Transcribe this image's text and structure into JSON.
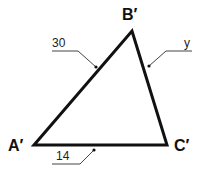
{
  "diagram": {
    "type": "triangle",
    "vertices": [
      {
        "id": "A",
        "label": "A′",
        "x": 34,
        "y": 145
      },
      {
        "id": "B",
        "label": "B′",
        "x": 132,
        "y": 31
      },
      {
        "id": "C",
        "label": "C′",
        "x": 167,
        "y": 145
      }
    ],
    "sides": [
      {
        "between": "A′B′",
        "label": "30"
      },
      {
        "between": "B′C′",
        "label": "y"
      },
      {
        "between": "A′C′",
        "label": "14"
      }
    ],
    "colors": {
      "stroke": "#111111",
      "leader": "#444444",
      "background": "#ffffff"
    }
  }
}
